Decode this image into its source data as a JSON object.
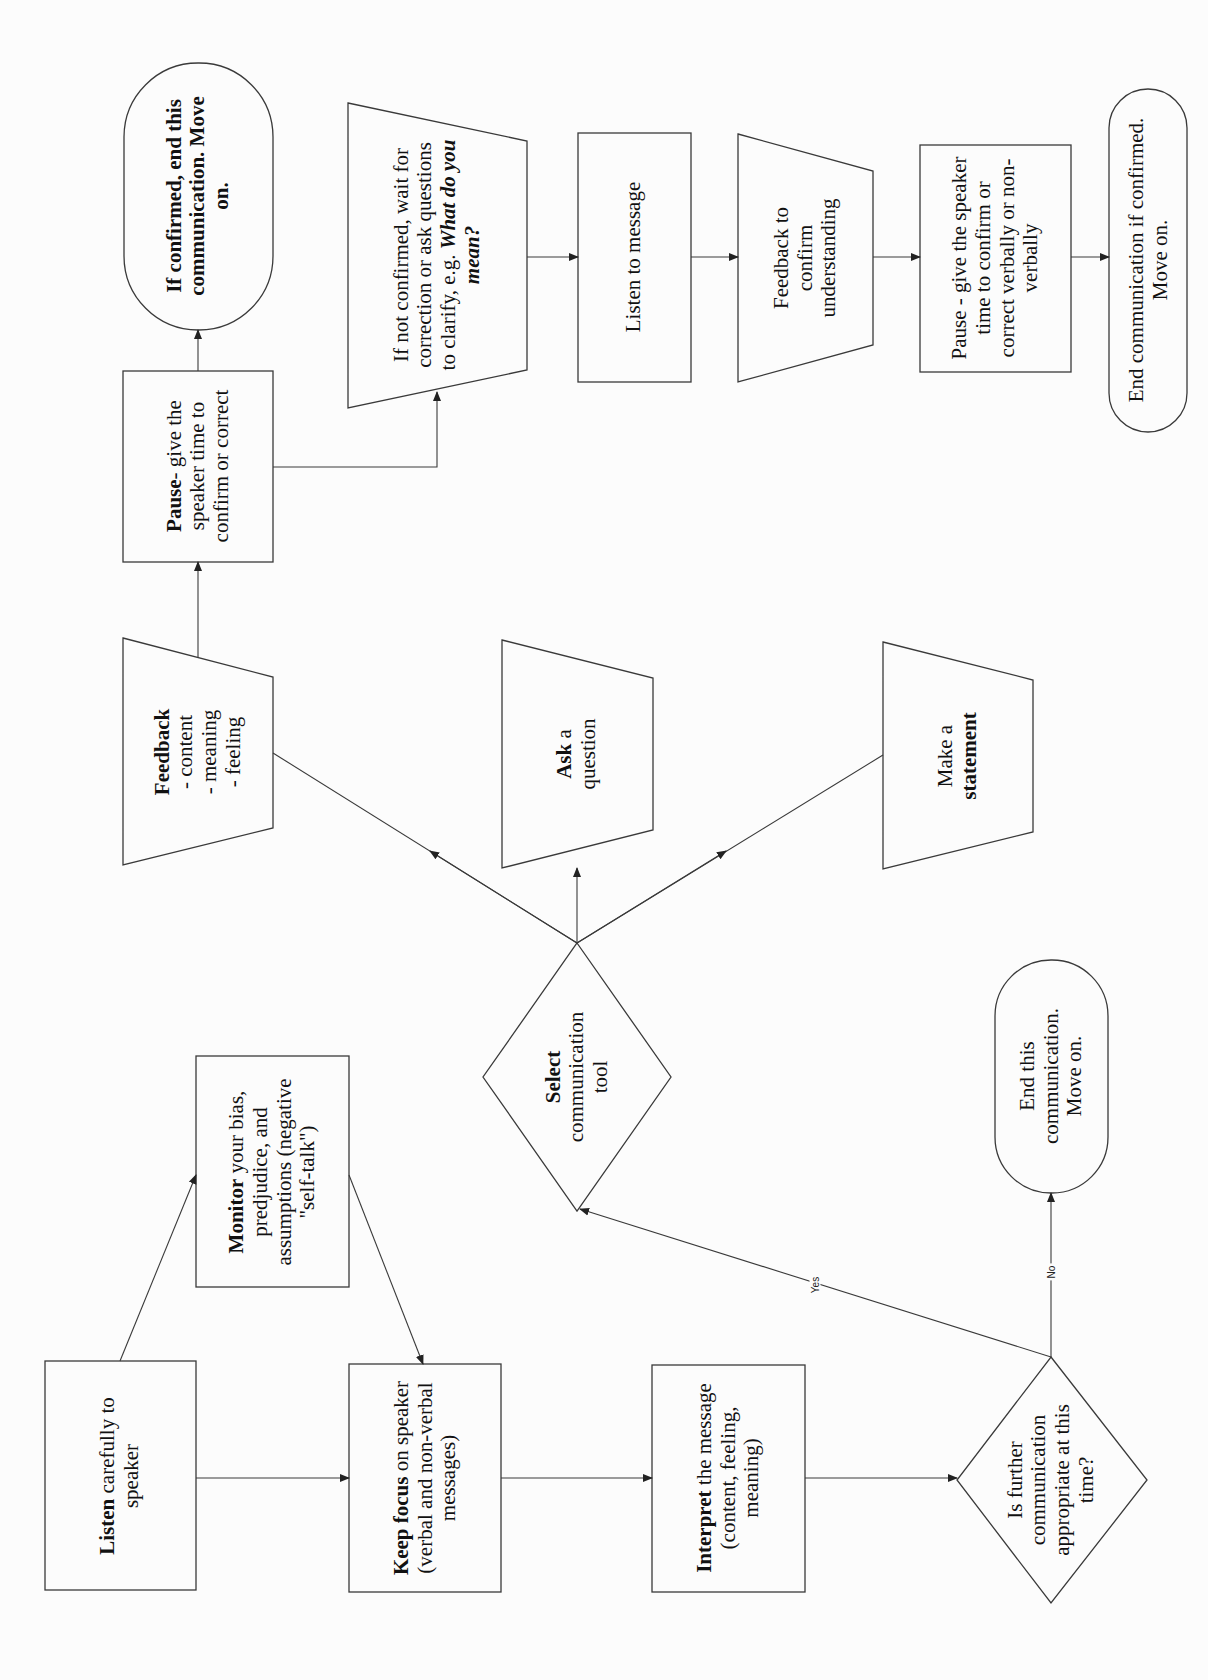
{
  "diagram": {
    "orientation": "rotated-90-ccw",
    "nodes": {
      "listen_carefully": {
        "bold": "Listen",
        "text": " carefully to speaker",
        "shape": "rectangle"
      },
      "monitor": {
        "bold": "Monitor",
        "text": " your bias, predjudice, and assumptions (negative \"self-talk\")",
        "shape": "rectangle"
      },
      "keep_focus": {
        "bold": "Keep focus",
        "text": " on speaker (verbal and non-verbal messages)",
        "shape": "rectangle"
      },
      "interpret": {
        "bold": "Interpret",
        "text": " the message (content, feeling,  meaning)",
        "shape": "rectangle"
      },
      "is_further": {
        "text": "Is further communication appropriate at this time?",
        "shape": "diamond"
      },
      "end_this": {
        "text": "End this communication. Move on.",
        "shape": "terminator"
      },
      "select_tool": {
        "bold": "Select",
        "text": " communication tool",
        "shape": "diamond"
      },
      "feedback": {
        "bold": "Feedback",
        "lines": [
          "- content",
          "- meaning",
          "- feeling"
        ],
        "shape": "manual-operation"
      },
      "ask_question": {
        "bold": "Ask",
        "text": " a question",
        "shape": "manual-operation"
      },
      "make_statement": {
        "text": "Make a ",
        "bold": "statement",
        "shape": "manual-operation"
      },
      "pause_1": {
        "bold": "Pause",
        "text": "- give the speaker time to confirm or correct",
        "shape": "rectangle"
      },
      "if_confirmed": {
        "text": "If confirmed, end this communication. Move on.",
        "shape": "terminator"
      },
      "if_not_confirmed": {
        "text": "If not confirmed, wait for correction or ask  questions to clarify, e.g. ",
        "italic": "What do you mean?",
        "shape": "manual-operation"
      },
      "listen_message": {
        "text": "Listen to message",
        "shape": "rectangle"
      },
      "feedback_confirm": {
        "text": "Feedback to confirm understanding",
        "shape": "manual-operation"
      },
      "pause_2": {
        "text": "Pause - give the speaker time to confirm or correct verbally or non-verbally",
        "shape": "rectangle"
      },
      "end_if_confirmed": {
        "text": "End communication if confirmed. Move on.",
        "shape": "terminator"
      }
    },
    "edge_labels": {
      "yes": "Yes",
      "no": "No"
    },
    "colors": {
      "stroke": "#3a3a3a",
      "text": "#111111",
      "background": "#fcfcfc"
    }
  }
}
